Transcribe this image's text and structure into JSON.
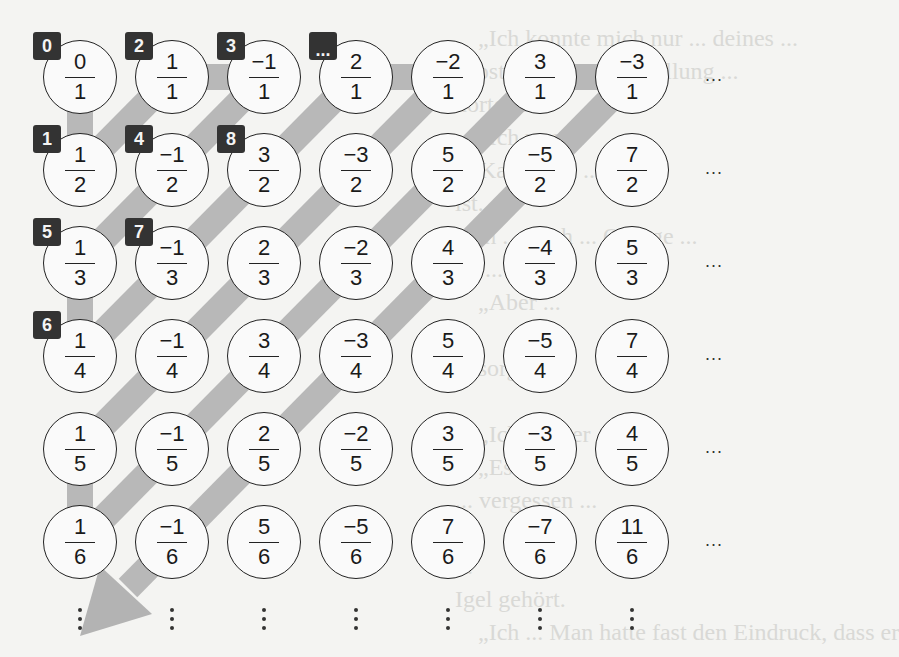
{
  "diagram": {
    "grid": {
      "rows": [
        [
          {
            "n": "0",
            "d": "1"
          },
          {
            "n": "1",
            "d": "1"
          },
          {
            "n": "−1",
            "d": "1"
          },
          {
            "n": "2",
            "d": "1"
          },
          {
            "n": "−2",
            "d": "1"
          },
          {
            "n": "3",
            "d": "1"
          },
          {
            "n": "−3",
            "d": "1"
          }
        ],
        [
          {
            "n": "1",
            "d": "2"
          },
          {
            "n": "−1",
            "d": "2"
          },
          {
            "n": "3",
            "d": "2"
          },
          {
            "n": "−3",
            "d": "2"
          },
          {
            "n": "5",
            "d": "2"
          },
          {
            "n": "−5",
            "d": "2"
          },
          {
            "n": "7",
            "d": "2"
          }
        ],
        [
          {
            "n": "1",
            "d": "3"
          },
          {
            "n": "−1",
            "d": "3"
          },
          {
            "n": "2",
            "d": "3"
          },
          {
            "n": "−2",
            "d": "3"
          },
          {
            "n": "4",
            "d": "3"
          },
          {
            "n": "−4",
            "d": "3"
          },
          {
            "n": "5",
            "d": "3"
          }
        ],
        [
          {
            "n": "1",
            "d": "4"
          },
          {
            "n": "−1",
            "d": "4"
          },
          {
            "n": "3",
            "d": "4"
          },
          {
            "n": "−3",
            "d": "4"
          },
          {
            "n": "5",
            "d": "4"
          },
          {
            "n": "−5",
            "d": "4"
          },
          {
            "n": "7",
            "d": "4"
          }
        ],
        [
          {
            "n": "1",
            "d": "5"
          },
          {
            "n": "−1",
            "d": "5"
          },
          {
            "n": "2",
            "d": "5"
          },
          {
            "n": "−2",
            "d": "5"
          },
          {
            "n": "3",
            "d": "5"
          },
          {
            "n": "−3",
            "d": "5"
          },
          {
            "n": "4",
            "d": "5"
          }
        ],
        [
          {
            "n": "1",
            "d": "6"
          },
          {
            "n": "−1",
            "d": "6"
          },
          {
            "n": "5",
            "d": "6"
          },
          {
            "n": "−5",
            "d": "6"
          },
          {
            "n": "7",
            "d": "6"
          },
          {
            "n": "−7",
            "d": "6"
          },
          {
            "n": "11",
            "d": "6"
          }
        ]
      ],
      "row_continuation": "...",
      "column_continuation": "⋮"
    },
    "badges": [
      {
        "label": "0",
        "row": 0,
        "col": 0
      },
      {
        "label": "1",
        "row": 1,
        "col": 0
      },
      {
        "label": "2",
        "row": 0,
        "col": 1
      },
      {
        "label": "3",
        "row": 0,
        "col": 2
      },
      {
        "label": "4",
        "row": 1,
        "col": 1
      },
      {
        "label": "5",
        "row": 2,
        "col": 0
      },
      {
        "label": "6",
        "row": 3,
        "col": 0
      },
      {
        "label": "7",
        "row": 2,
        "col": 1
      },
      {
        "label": "8",
        "row": 1,
        "col": 2
      },
      {
        "label": "...",
        "row": 0,
        "col": 3
      }
    ],
    "path": {
      "description": "Gray zigzag path over the diagonals, ending in an arrow pointing down-left",
      "color": "#b8b8b8",
      "arrow_color": "#b3b3b3"
    },
    "colors": {
      "badge": "#333333",
      "circle_border": "#222222",
      "background": "#f4f4f2"
    },
    "background_bleedthrough": [
      "„Ich konnte mich nur ... deines ...",
      "Trost ... sehr ... Vorstellung ... ",
      "hörte ... ",
      "„Ich war ... ",
      "... Kannst du ...",
      "ist.",
      "„Ich ... noch ... Orange ...",
      "du ... ",
      "„Aber ... ",
      "... ",
      "gesorgt.",
      "„Ich ... aber ... ",
      "„Es ... ",
      "... vergessen ... ",
      "... ",
      "... ",
      "Igel gehört.",
      "„Ich ... Man hatte fast den Eindruck, dass er"
    ]
  }
}
